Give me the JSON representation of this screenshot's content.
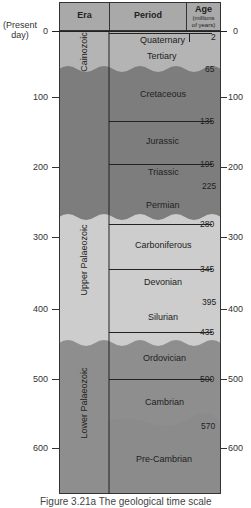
{
  "header": {
    "era": "Era",
    "period": "Period",
    "age_title": "Age",
    "age_sub1": "(millions",
    "age_sub2": "of years)"
  },
  "present_day_label_1": "(Present",
  "present_day_label_2": "day)",
  "left_scale": [
    "0",
    "100",
    "200",
    "300",
    "400",
    "500",
    "600"
  ],
  "right_scale": [
    "0",
    "100",
    "200",
    "300",
    "400",
    "500",
    "600"
  ],
  "eras": [
    {
      "name": "Cainozoic",
      "start": 0,
      "end": 65,
      "color": "#b4b4b4"
    },
    {
      "name": "Mesozoic (unlabelled)",
      "start": 65,
      "end": 225,
      "color": "#7d7d7d"
    },
    {
      "name": "Upper Palaeozoic",
      "start": 225,
      "end": 395,
      "color": "#cdcdcd"
    },
    {
      "name": "Lower Palaeozoic",
      "start": 395,
      "end": 640,
      "color": "#8e8e8e"
    }
  ],
  "era_labels": {
    "cainozoic": "Cainozoic",
    "upper_palaeozoic": "Upper Palaeozoic",
    "lower_palaeozoic": "Lower Palaeozoic"
  },
  "periods": [
    {
      "name": "Quaternary",
      "start": 0,
      "end": 2
    },
    {
      "name": "Tertiary",
      "start": 2,
      "end": 65
    },
    {
      "name": "Cretaceous",
      "start": 65,
      "end": 135
    },
    {
      "name": "Jurassic",
      "start": 135,
      "end": 195
    },
    {
      "name": "Triassic",
      "start": 195,
      "end": 225
    },
    {
      "name": "Permian",
      "start": 225,
      "end": 280
    },
    {
      "name": "Carboniferous",
      "start": 280,
      "end": 345
    },
    {
      "name": "Devonian",
      "start": 345,
      "end": 395
    },
    {
      "name": "Silurian",
      "start": 395,
      "end": 435
    },
    {
      "name": "Ordovician",
      "start": 435,
      "end": 500
    },
    {
      "name": "Cambrian",
      "start": 500,
      "end": 570
    },
    {
      "name": "Pre-Cambrian",
      "start": 570,
      "end": null
    }
  ],
  "boundary_ages": [
    "2",
    "65",
    "135",
    "195",
    "225",
    "280",
    "345",
    "395",
    "435",
    "500",
    "570"
  ],
  "caption": "Figure 3.21a   The geological time scale"
}
